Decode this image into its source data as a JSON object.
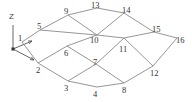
{
  "diagram": {
    "type": "node-edge graph (truss/mesh)",
    "axis": {
      "z_label": "Z",
      "origin": [
        13,
        49
      ],
      "z_end": [
        13,
        25
      ],
      "x_arrow_end": [
        32,
        41
      ],
      "y_arrow_end": [
        34,
        60
      ],
      "z_label_pos": [
        9,
        19
      ]
    },
    "nodes": [
      {
        "id": "1",
        "x": 22,
        "y": 42,
        "lx": 18,
        "ly": 41
      },
      {
        "id": "2",
        "x": 38,
        "y": 63,
        "lx": 36,
        "ly": 73
      },
      {
        "id": "3",
        "x": 68,
        "y": 81,
        "lx": 64,
        "ly": 91
      },
      {
        "id": "4",
        "x": 97,
        "y": 87,
        "lx": 93,
        "ly": 97
      },
      {
        "id": "5",
        "x": 40,
        "y": 30,
        "lx": 37,
        "ly": 29
      },
      {
        "id": "6",
        "x": 67,
        "y": 46,
        "lx": 64,
        "ly": 56
      },
      {
        "id": "7",
        "x": 96,
        "y": 64,
        "lx": 93,
        "ly": 65
      },
      {
        "id": "8",
        "x": 124,
        "y": 83,
        "lx": 122,
        "ly": 93
      },
      {
        "id": "9",
        "x": 68,
        "y": 15,
        "lx": 64,
        "ly": 14
      },
      {
        "id": "10",
        "x": 97,
        "y": 35,
        "lx": 90,
        "ly": 43
      },
      {
        "id": "11",
        "x": 124,
        "y": 38,
        "lx": 119,
        "ly": 52
      },
      {
        "id": "12",
        "x": 153,
        "y": 66,
        "lx": 150,
        "ly": 76
      },
      {
        "id": "13",
        "x": 97,
        "y": 8,
        "lx": 91,
        "ly": 8
      },
      {
        "id": "14",
        "x": 124,
        "y": 13,
        "lx": 122,
        "ly": 13
      },
      {
        "id": "15",
        "x": 154,
        "y": 32,
        "lx": 152,
        "ly": 32
      },
      {
        "id": "16",
        "x": 177,
        "y": 38,
        "lx": 176,
        "ly": 43
      }
    ],
    "edges": [
      [
        "1",
        "2"
      ],
      [
        "1",
        "5"
      ],
      [
        "5",
        "9"
      ],
      [
        "9",
        "13"
      ],
      [
        "13",
        "14"
      ],
      [
        "14",
        "15"
      ],
      [
        "15",
        "16"
      ],
      [
        "5",
        "10"
      ],
      [
        "9",
        "10"
      ],
      [
        "14",
        "10"
      ],
      [
        "10",
        "11"
      ],
      [
        "11",
        "15"
      ],
      [
        "6",
        "10"
      ],
      [
        "2",
        "6"
      ],
      [
        "6",
        "7"
      ],
      [
        "2",
        "3"
      ],
      [
        "3",
        "7"
      ],
      [
        "3",
        "4"
      ],
      [
        "4",
        "8"
      ],
      [
        "7",
        "8"
      ],
      [
        "7",
        "11"
      ],
      [
        "11",
        "12"
      ],
      [
        "12",
        "16"
      ],
      [
        "8",
        "12"
      ]
    ]
  }
}
